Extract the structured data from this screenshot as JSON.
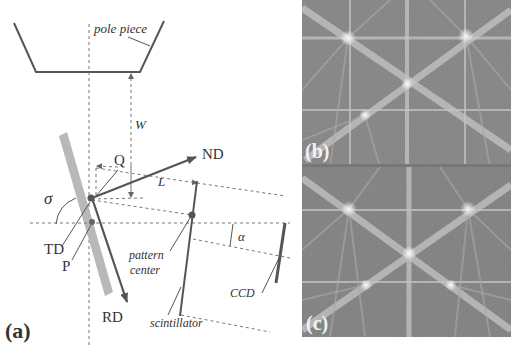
{
  "figure": {
    "panel_a": {
      "label": "(a)",
      "pole_piece_label": "pole piece",
      "working_distance_label": "W",
      "detector_distance_label": "L",
      "tilt_angle_label": "σ",
      "camera_angle_label": "α",
      "axes": {
        "normal": "ND",
        "rolling": "RD",
        "transverse": "TD"
      },
      "points": {
        "q": "Q",
        "p": "P"
      },
      "pattern_center_label_line1": "pattern",
      "pattern_center_label_line2": "center",
      "scintillator_label": "scintillator",
      "ccd_label": "CCD"
    },
    "panel_b": {
      "label": "(b)",
      "content": "Kikuchi diffraction pattern (EBSP)"
    },
    "panel_c": {
      "label": "(c)",
      "content": "Kikuchi diffraction pattern (EBSP)"
    },
    "colors": {
      "line": "#555555",
      "dashed": "#777777",
      "sample": "#b8b8b8",
      "pattern_bg": "#8a8a8a",
      "band": "#bdbdbd"
    }
  }
}
